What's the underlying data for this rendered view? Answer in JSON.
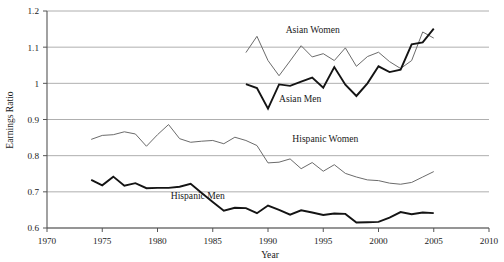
{
  "chart_data": {
    "type": "line",
    "title": "",
    "xlabel": "Year",
    "ylabel": "Earnings Ratio",
    "xlim": [
      1970,
      2010
    ],
    "ylim": [
      0.6,
      1.2
    ],
    "xticks": [
      1970,
      1975,
      1980,
      1985,
      1990,
      1995,
      2000,
      2005,
      2010
    ],
    "yticks": [
      "0.6",
      "0.7",
      "0.8",
      "0.9",
      "1",
      "1.1",
      "1.2"
    ],
    "ytick_values": [
      0.6,
      0.7,
      0.8,
      0.9,
      1.0,
      1.1,
      1.2
    ],
    "grid": "horizontal",
    "legend_position": "inline-annotations",
    "series": [
      {
        "name": "Asian Women",
        "style": "thin-gray",
        "color": "#6b6b6b",
        "label_x": 1991.6,
        "label_y": 1.139,
        "x": [
          1988,
          1989,
          1990,
          1991,
          1992,
          1993,
          1994,
          1995,
          1996,
          1997,
          1998,
          1999,
          2000,
          2001,
          2002,
          2003,
          2004,
          2005
        ],
        "values": [
          1.085,
          1.13,
          1.063,
          1.021,
          1.062,
          1.104,
          1.073,
          1.082,
          1.063,
          1.098,
          1.047,
          1.074,
          1.086,
          1.06,
          1.041,
          1.063,
          1.142,
          1.125
        ]
      },
      {
        "name": "Asian Men",
        "style": "thick-black",
        "color": "#141414",
        "label_x": 1991.0,
        "label_y": 0.948,
        "x": [
          1988,
          1989,
          1990,
          1991,
          1992,
          1993,
          1994,
          1995,
          1996,
          1997,
          1998,
          1999,
          2000,
          2001,
          2002,
          2003,
          2004,
          2005
        ],
        "values": [
          0.998,
          0.987,
          0.93,
          0.997,
          0.993,
          1.005,
          1.016,
          0.988,
          1.045,
          0.996,
          0.965,
          1.0,
          1.047,
          1.031,
          1.038,
          1.108,
          1.113,
          1.151
        ]
      },
      {
        "name": "Hispanic Women",
        "style": "thin-gray",
        "color": "#6b6b6b",
        "label_x": 1992.2,
        "label_y": 0.838,
        "x": [
          1974,
          1975,
          1976,
          1977,
          1978,
          1979,
          1980,
          1981,
          1982,
          1983,
          1984,
          1985,
          1986,
          1987,
          1988,
          1989,
          1990,
          1991,
          1992,
          1993,
          1994,
          1995,
          1996,
          1997,
          1998,
          1999,
          2000,
          2001,
          2002,
          2003,
          2004,
          2005
        ],
        "values": [
          0.845,
          0.856,
          0.858,
          0.866,
          0.86,
          0.826,
          0.858,
          0.886,
          0.847,
          0.837,
          0.84,
          0.842,
          0.833,
          0.851,
          0.842,
          0.828,
          0.78,
          0.782,
          0.791,
          0.764,
          0.781,
          0.757,
          0.775,
          0.751,
          0.741,
          0.733,
          0.731,
          0.724,
          0.721,
          0.726,
          0.741,
          0.756
        ]
      },
      {
        "name": "Hispanic Men",
        "style": "thick-black",
        "color": "#141414",
        "label_x": 1981.2,
        "label_y": 0.679,
        "x": [
          1974,
          1975,
          1976,
          1977,
          1978,
          1979,
          1980,
          1981,
          1982,
          1983,
          1984,
          1985,
          1986,
          1987,
          1988,
          1989,
          1990,
          1991,
          1992,
          1993,
          1994,
          1995,
          1996,
          1997,
          1998,
          1999,
          2000,
          2001,
          2002,
          2003,
          2004,
          2005
        ],
        "values": [
          0.733,
          0.718,
          0.742,
          0.717,
          0.724,
          0.71,
          0.711,
          0.711,
          0.714,
          0.722,
          0.697,
          0.672,
          0.648,
          0.656,
          0.655,
          0.641,
          0.662,
          0.65,
          0.637,
          0.649,
          0.643,
          0.636,
          0.64,
          0.639,
          0.615,
          0.616,
          0.617,
          0.629,
          0.644,
          0.638,
          0.643,
          0.641
        ]
      }
    ]
  }
}
